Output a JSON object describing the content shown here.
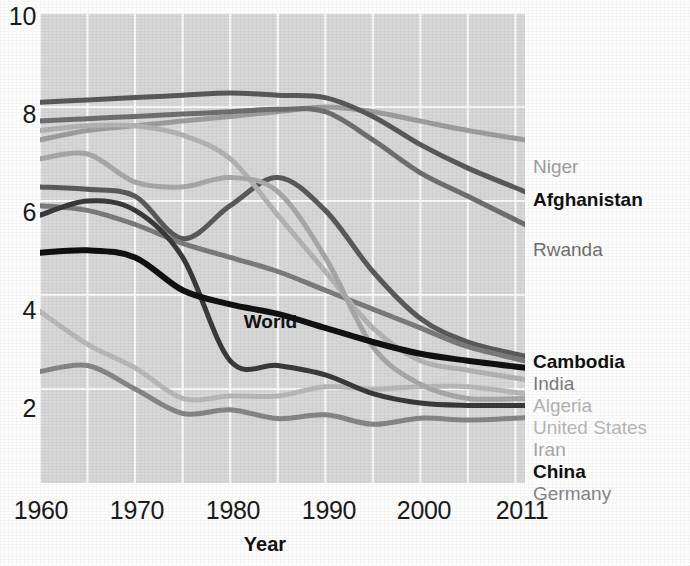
{
  "chart_data": {
    "type": "line",
    "title": "",
    "xlabel": "Year",
    "ylabel": "",
    "xlim": [
      1960,
      2011
    ],
    "ylim": [
      0,
      10
    ],
    "grid": true,
    "legend_position": "right",
    "x_ticks": [
      "1960",
      "1970",
      "1980",
      "1990",
      "2000",
      "2011"
    ],
    "x_tick_values": [
      1960,
      1970,
      1980,
      1990,
      2000,
      2011
    ],
    "y_ticks": [
      "2",
      "4",
      "6",
      "8",
      "10"
    ],
    "y_tick_values": [
      2,
      4,
      6,
      8,
      10
    ],
    "inline_annotations": [
      {
        "text": "World",
        "x": 1985,
        "y": 3.45
      }
    ],
    "x": [
      1960,
      1965,
      1970,
      1975,
      1980,
      1985,
      1990,
      1995,
      2000,
      2005,
      2011
    ],
    "series": [
      {
        "name": "Niger",
        "color": "#9e9e9e",
        "bold": false,
        "width": 5,
        "legend_y": 157,
        "values": [
          7.3,
          7.5,
          7.6,
          7.7,
          7.8,
          7.9,
          8.0,
          7.9,
          7.7,
          7.5,
          7.3
        ]
      },
      {
        "name": "Afghanistan",
        "color": "#595959",
        "bold": true,
        "width": 5,
        "legend_y": 190,
        "values": [
          8.1,
          8.15,
          8.2,
          8.25,
          8.3,
          8.25,
          8.2,
          7.8,
          7.2,
          6.7,
          6.2
        ]
      },
      {
        "name": "Rwanda",
        "color": "#6f6f6f",
        "bold": false,
        "width": 5,
        "legend_y": 240,
        "values": [
          7.7,
          7.75,
          7.8,
          7.85,
          7.9,
          7.95,
          7.9,
          7.3,
          6.6,
          6.1,
          5.5
        ]
      },
      {
        "name": "Cambodia",
        "color": "#5a5a5a",
        "bold": true,
        "width": 5,
        "legend_y": 352,
        "values": [
          6.3,
          6.25,
          6.1,
          5.2,
          5.9,
          6.5,
          5.8,
          4.5,
          3.5,
          3.0,
          2.7
        ]
      },
      {
        "name": "India",
        "color": "#7b7b7b",
        "bold": false,
        "width": 5,
        "legend_y": 374,
        "values": [
          5.9,
          5.8,
          5.5,
          5.1,
          4.8,
          4.5,
          4.1,
          3.7,
          3.3,
          2.9,
          2.6
        ]
      },
      {
        "name": "Algeria",
        "color": "#b4b4b4",
        "bold": false,
        "width": 5,
        "legend_y": 396,
        "values": [
          7.5,
          7.6,
          7.6,
          7.4,
          6.9,
          5.7,
          4.5,
          3.3,
          2.6,
          2.4,
          2.2
        ]
      },
      {
        "name": "United States",
        "color": "#b9b9b9",
        "bold": false,
        "width": 5,
        "legend_y": 418,
        "values": [
          3.65,
          2.95,
          2.45,
          1.8,
          1.85,
          1.85,
          2.05,
          2.0,
          2.05,
          2.05,
          1.9
        ]
      },
      {
        "name": "Iran",
        "color": "#a8a8a8",
        "bold": false,
        "width": 5,
        "legend_y": 440,
        "values": [
          6.9,
          7.0,
          6.4,
          6.3,
          6.5,
          6.2,
          4.8,
          2.9,
          2.1,
          1.8,
          1.8
        ]
      },
      {
        "name": "China",
        "color": "#3a3a3a",
        "bold": true,
        "width": 5,
        "legend_y": 462,
        "values": [
          5.7,
          6.0,
          5.8,
          4.8,
          2.6,
          2.5,
          2.3,
          1.9,
          1.7,
          1.65,
          1.65
        ]
      },
      {
        "name": "Germany",
        "color": "#868686",
        "bold": false,
        "width": 5,
        "legend_y": 484,
        "values": [
          2.37,
          2.5,
          2.0,
          1.48,
          1.56,
          1.37,
          1.45,
          1.25,
          1.38,
          1.34,
          1.39
        ]
      },
      {
        "name": "World",
        "color": "#111111",
        "bold": true,
        "width": 6,
        "legend_y": null,
        "values": [
          4.9,
          4.95,
          4.8,
          4.1,
          3.8,
          3.6,
          3.3,
          3.0,
          2.75,
          2.6,
          2.45
        ]
      }
    ]
  },
  "colors": {
    "plot_background": "#d8d8d8",
    "gridline": "#ffffff",
    "axis_text": "#1a1a1a",
    "page_background": "#ffffff"
  }
}
